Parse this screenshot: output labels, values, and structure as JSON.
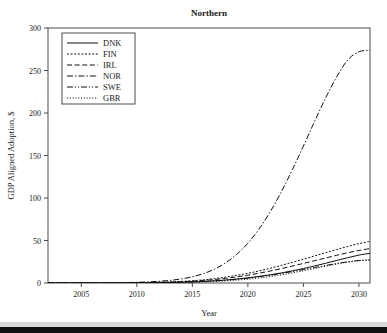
{
  "chart_data": {
    "type": "line",
    "title": "Northern",
    "xlabel": "Year",
    "ylabel": "GDP Aligned Adoption, $",
    "xlim": [
      2002,
      2031
    ],
    "ylim": [
      0,
      300
    ],
    "xticks": [
      2005,
      2010,
      2015,
      2020,
      2025,
      2030
    ],
    "yticks": [
      0,
      50,
      100,
      150,
      200,
      250,
      300
    ],
    "grid": false,
    "legend_position": "upper-left",
    "x": [
      2002,
      2003,
      2004,
      2005,
      2006,
      2007,
      2008,
      2009,
      2010,
      2011,
      2012,
      2013,
      2014,
      2015,
      2016,
      2017,
      2018,
      2019,
      2020,
      2021,
      2022,
      2023,
      2024,
      2025,
      2026,
      2027,
      2028,
      2029,
      2030,
      2031
    ],
    "series": [
      {
        "name": "DNK",
        "dash": "solid",
        "values": [
          0,
          0,
          0,
          0,
          0,
          0,
          0.1,
          0.1,
          0.2,
          0.3,
          0.4,
          0.6,
          0.9,
          1.3,
          1.9,
          2.6,
          3.5,
          4.6,
          6.0,
          7.7,
          9.6,
          11.8,
          14.3,
          17.0,
          20.0,
          23.2,
          26.5,
          29.8,
          32.8,
          35.0
        ]
      },
      {
        "name": "FIN",
        "dash": "fine-dash",
        "values": [
          0,
          0,
          0,
          0,
          0.1,
          0.1,
          0.2,
          0.3,
          0.4,
          0.6,
          0.9,
          1.3,
          1.9,
          2.7,
          3.8,
          5.2,
          6.9,
          9.0,
          11.4,
          14.2,
          17.3,
          20.7,
          24.3,
          28.0,
          31.8,
          35.6,
          39.4,
          43.0,
          46.3,
          49.0
        ]
      },
      {
        "name": "IRL",
        "dash": "dash",
        "values": [
          0,
          0,
          0,
          0,
          0,
          0.1,
          0.1,
          0.2,
          0.3,
          0.4,
          0.7,
          1.0,
          1.5,
          2.1,
          3.0,
          4.1,
          5.5,
          7.2,
          9.2,
          11.5,
          14.1,
          16.9,
          19.9,
          23.0,
          26.2,
          29.4,
          32.6,
          35.6,
          38.3,
          40.5
        ]
      },
      {
        "name": "NOR",
        "dash": "dash-dot",
        "values": [
          0,
          0,
          0,
          0,
          0.1,
          0.2,
          0.3,
          0.5,
          0.8,
          1.3,
          2.0,
          3.1,
          4.8,
          7.3,
          11.0,
          16.3,
          23.7,
          33.7,
          46.8,
          63.4,
          83.5,
          106.9,
          133.1,
          161.1,
          189.8,
          217.6,
          242.5,
          262.5,
          272.0,
          274.0
        ]
      },
      {
        "name": "SWE",
        "dash": "dash-dot-dot",
        "values": [
          0,
          0,
          0,
          0,
          0,
          0,
          0.1,
          0.1,
          0.2,
          0.3,
          0.4,
          0.6,
          0.9,
          1.3,
          1.8,
          2.5,
          3.4,
          4.5,
          5.8,
          7.4,
          9.2,
          11.2,
          13.4,
          15.8,
          18.2,
          20.6,
          22.9,
          24.9,
          26.4,
          27.2
        ]
      },
      {
        "name": "GBR",
        "dash": "dot",
        "values": [
          0,
          0,
          0,
          0,
          0,
          0,
          0,
          0.1,
          0.1,
          0.2,
          0.3,
          0.4,
          0.6,
          0.9,
          1.3,
          1.8,
          2.5,
          3.4,
          4.5,
          5.9,
          7.6,
          9.6,
          11.9,
          14.4,
          17.0,
          19.7,
          22.3,
          24.6,
          26.3,
          27.0
        ]
      }
    ]
  }
}
